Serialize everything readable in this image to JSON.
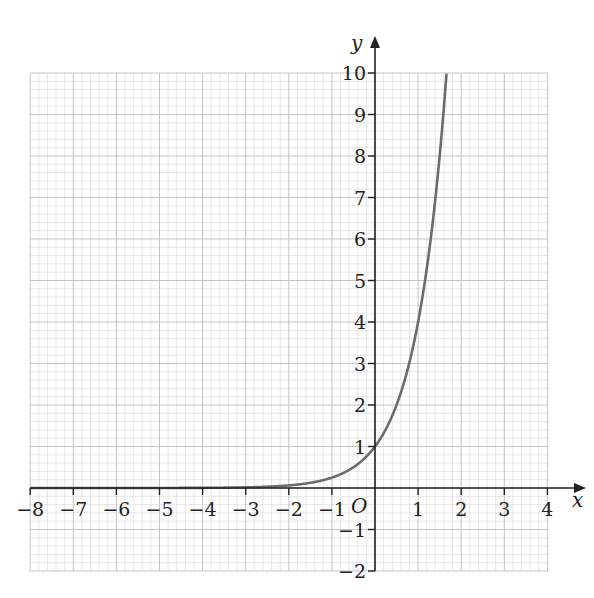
{
  "chart_data": {
    "type": "line",
    "title": "",
    "xlabel": "x",
    "ylabel": "y",
    "origin_label": "O",
    "xlim": [
      -8,
      4
    ],
    "ylim": [
      -2,
      10
    ],
    "x_ticks": [
      -8,
      -7,
      -6,
      -5,
      -4,
      -3,
      -2,
      -1,
      1,
      2,
      3,
      4
    ],
    "x_tick_labels": [
      "−8",
      "−7",
      "−6",
      "−5",
      "−4",
      "−3",
      "−2",
      "−1",
      "1",
      "2",
      "3",
      "4"
    ],
    "y_ticks": [
      -2,
      -1,
      1,
      2,
      3,
      4,
      5,
      6,
      7,
      8,
      9,
      10
    ],
    "y_tick_labels": [
      "−2",
      "−1",
      "1",
      "2",
      "3",
      "4",
      "5",
      "6",
      "7",
      "8",
      "9",
      "10"
    ],
    "grid": {
      "on": true,
      "major_step": 1,
      "minor_per_major": 5
    },
    "legend": null,
    "series": [
      {
        "name": "y = 4^x",
        "function": "4^x",
        "x": [
          -8,
          -3,
          -2,
          -1,
          0,
          0.5,
          1,
          1.161,
          1.5,
          1.661
        ],
        "y": [
          2e-05,
          0.016,
          0.0625,
          0.25,
          1,
          2,
          4,
          5,
          8,
          10
        ]
      }
    ],
    "colors": {
      "curve": "#6b6b6b",
      "axes": "#222222",
      "grid_major": "#c4c4c4",
      "grid_minor": "#e0e0e0"
    }
  }
}
